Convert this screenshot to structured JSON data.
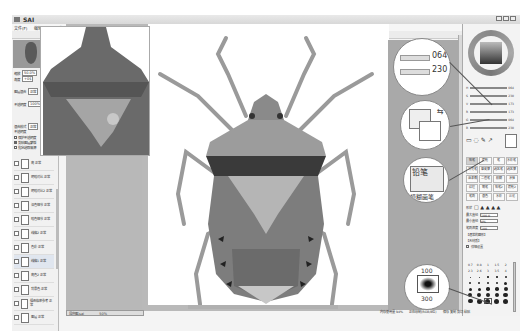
{
  "window": {
    "app_title": "SAI",
    "menu": [
      "文件(F)",
      "编辑(E)",
      "图像(C)",
      "图层(L)",
      "选择(S)",
      "滤镜(T)",
      "视图(V)",
      "窗口(W)",
      "帮助(H)"
    ],
    "toolbar": {
      "selection_label": "抗锯齿",
      "zoom_value": "100",
      "angle_value": "0000",
      "rotate_label": "正常",
      "mode_value": "PSD图层",
      "zoom_display": "100%"
    }
  },
  "left_panel": {
    "zoom_label": "缩放",
    "zoom_value": "50.0%",
    "angle_label": "角度",
    "angle_value": "+0$",
    "fields": [
      {
        "label": "图层混合",
        "value": "正常"
      },
      {
        "label": "不透明度",
        "value": "100%"
      }
    ],
    "blend_label": "混合模式",
    "blend_value": "正常",
    "opacity_label": "不透明度",
    "checks": [
      {
        "label": "保护不透明度",
        "checked": false
      },
      {
        "label": "剪贴图层蒙版",
        "checked": true
      },
      {
        "label": "指定选取来源",
        "checked": false
      }
    ],
    "layers": [
      {
        "name": "亮\n正常"
      },
      {
        "name": "明暗对比\n正常"
      },
      {
        "name": "明暗对比2\n正常"
      },
      {
        "name": "深色细节\n正常"
      },
      {
        "name": "暗色细节\n正常"
      },
      {
        "name": "线稿2\n正常"
      },
      {
        "name": "色彩\n正常"
      },
      {
        "name": "线稿1\n正常"
      },
      {
        "name": "亮色2\n正常"
      },
      {
        "name": "背景色\n正常"
      },
      {
        "name": "插画临摹参考\n正常"
      },
      {
        "name": "图层\n正常"
      }
    ]
  },
  "canvas": {
    "tab_label": "昆虫图.sai",
    "tab_zoom": "50%"
  },
  "callouts": {
    "hsv_values": [
      "064",
      "230"
    ],
    "extra_value": "230",
    "brush_tool_label": "铅笔",
    "brush_tool_caption": "模糊画笔",
    "brush_size_top": "100",
    "brush_size_bottom": "300"
  },
  "right_panel": {
    "sliders": [
      {
        "label": "H",
        "value": "064"
      },
      {
        "label": "S",
        "value": "230"
      },
      {
        "label": "V",
        "value": "173"
      },
      {
        "label": "R",
        "value": "173"
      },
      {
        "label": "G",
        "value": "064"
      },
      {
        "label": "B",
        "value": "230"
      }
    ],
    "brushes": [
      "铅笔",
      "喷枪",
      "笔",
      "水彩笔",
      "马克笔",
      "橡皮擦",
      "选区笔",
      "选区擦",
      "油漆桶",
      "二值笔",
      "模糊",
      "涂抹",
      "纹理",
      "钢笔",
      "铅笔2",
      "喷枪2",
      "笔刷",
      "混色",
      "水彩",
      "淡化"
    ],
    "shape_label": "形状",
    "max_size_label": "最大直径",
    "max_size_value": "100.0",
    "min_size_label": "最小直径",
    "min_size_value": "0%",
    "density_label": "笔刷浓度",
    "density_value": "100",
    "option1_label": "【通常的圆形】",
    "option2_label": "【无材质】",
    "detail_label": "详细设置",
    "size_presets": [
      "0.7",
      "0.8",
      "1",
      "1.5",
      "2",
      "2.3",
      "2.6",
      "3",
      "3.5",
      "4",
      "5",
      "6",
      "7",
      "8",
      "9",
      "10",
      "12",
      "14",
      "16",
      "20",
      "25",
      "30",
      "35",
      "40",
      "50",
      "60",
      "70",
      "80",
      "100",
      "120",
      "160",
      "200",
      "250",
      "300",
      "350"
    ]
  },
  "statusbar": {
    "memory": "内存使用量 94%",
    "info": "正在绘制(RGB/8位)",
    "keys": "保存 复制 剪切 粘贴"
  }
}
